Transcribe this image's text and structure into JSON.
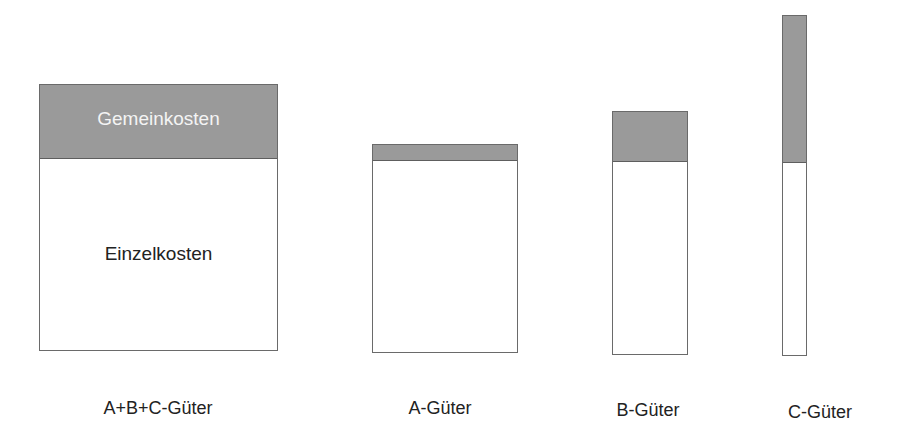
{
  "diagram": {
    "title": "",
    "colors": {
      "overhead": "#9a9a9a",
      "direct": "#ffffff",
      "border": "#6a6a6a"
    },
    "legend": {
      "overhead_label": "Gemeinkosten",
      "direct_label": "Einzelkosten"
    },
    "bars": [
      {
        "id": "abc",
        "caption": "A+B+C-Güter",
        "overhead_share": "approx. 27%"
      },
      {
        "id": "a",
        "caption": "A-Güter",
        "overhead_share": "approx. 7%"
      },
      {
        "id": "b",
        "caption": "B-Güter",
        "overhead_share": "approx. 20%"
      },
      {
        "id": "c",
        "caption": "C-Güter",
        "overhead_share": "approx. 43%"
      }
    ]
  }
}
